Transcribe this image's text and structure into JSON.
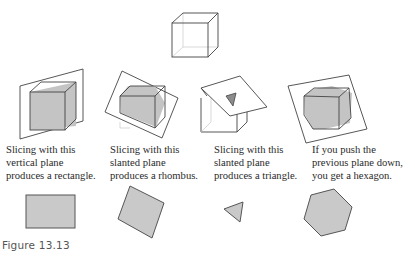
{
  "figure": {
    "label": "Figure 13.13",
    "colors": {
      "edge": "#444444",
      "shade": "#c4c4c4",
      "shape_fill": "#c9c9c9",
      "hidden_edge": "#c8c8c8"
    },
    "panels": [
      {
        "id": "rectangle",
        "caption_lines": [
          "Slicing with this",
          "vertical plane",
          "produces a rectangle."
        ],
        "result_shape": "rectangle"
      },
      {
        "id": "rhombus",
        "caption_lines": [
          "Slicing with this",
          "slanted plane",
          "produces a rhombus."
        ],
        "result_shape": "rhombus"
      },
      {
        "id": "triangle",
        "caption_lines": [
          "Slicing with this",
          "slanted plane",
          "produces a triangle."
        ],
        "result_shape": "triangle"
      },
      {
        "id": "hexagon",
        "caption_lines": [
          "If you push the",
          "previous plane down,",
          "you get a hexagon."
        ],
        "result_shape": "hexagon"
      }
    ]
  }
}
